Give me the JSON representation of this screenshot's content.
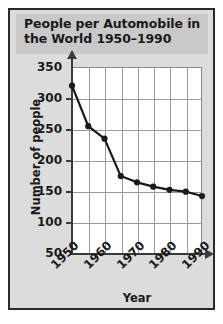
{
  "figure": {
    "title": "People per Automobile in the World 1950–1990",
    "title_line1": "People per Automobile in",
    "title_line2": "the World 1950–1990",
    "background_color": "#dcdcdc",
    "border_color": "#2b2b2b",
    "plot_background_color": "#ffffff",
    "grid_color": "#9a9a9a",
    "axis_color": "#3a3a3a",
    "series_color": "#1a1a1a"
  },
  "chart_data": {
    "type": "line",
    "title": "People per Automobile in the World 1950–1990",
    "xlabel": "Year",
    "ylabel": "Number of people",
    "x": [
      1950,
      1955,
      1960,
      1965,
      1970,
      1975,
      1980,
      1985,
      1990
    ],
    "values": [
      320,
      255,
      235,
      175,
      165,
      158,
      153,
      150,
      143
    ],
    "series": [
      {
        "name": "People per automobile",
        "values": [
          320,
          255,
          235,
          175,
          165,
          158,
          153,
          150,
          143
        ]
      }
    ],
    "xlim": [
      1950,
      1990
    ],
    "ylim": [
      50,
      350
    ],
    "xticks": [
      1950,
      1960,
      1970,
      1980,
      1990
    ],
    "xtick_labels": [
      "1950",
      "1960",
      "1970",
      "1980",
      "1990"
    ],
    "yticks": [
      50,
      100,
      150,
      200,
      250,
      300,
      350
    ],
    "ytick_labels": [
      "50",
      "100",
      "150",
      "200",
      "250",
      "300",
      "350"
    ],
    "grid": true,
    "legend": false,
    "markers": "filled-circle",
    "xtick_rotation": -45
  }
}
